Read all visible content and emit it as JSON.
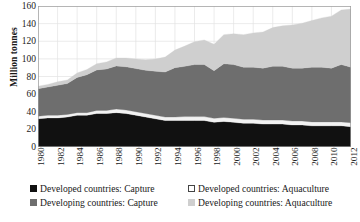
{
  "chart_data": {
    "type": "area",
    "stacked": true,
    "title": "",
    "xlabel": "",
    "ylabel": "Million tonnes",
    "ylim": [
      0,
      160
    ],
    "ytick_step": 20,
    "yticks": [
      0,
      20,
      40,
      60,
      80,
      100,
      120,
      140,
      160
    ],
    "grid": true,
    "grid_style": "light vertical and horizontal gridlines",
    "legend_position": "bottom",
    "x": [
      1980,
      1981,
      1982,
      1983,
      1984,
      1985,
      1986,
      1987,
      1988,
      1989,
      1990,
      1991,
      1992,
      1993,
      1994,
      1995,
      1996,
      1997,
      1998,
      1999,
      2000,
      2001,
      2002,
      2003,
      2004,
      2005,
      2006,
      2007,
      2008,
      2009,
      2010,
      2011,
      2012
    ],
    "xticks": [
      1980,
      1982,
      1984,
      1986,
      1988,
      1990,
      1992,
      1994,
      1996,
      1998,
      2000,
      2002,
      2004,
      2006,
      2008,
      2010,
      2012
    ],
    "series": [
      {
        "name": "Developed countries: Capture",
        "color": "#111111",
        "values": [
          32,
          33,
          33,
          34,
          36,
          36,
          38,
          38,
          39,
          38,
          36,
          34,
          32,
          30,
          30,
          30,
          30,
          30,
          28,
          29,
          28,
          27,
          27,
          26,
          26,
          26,
          25,
          25,
          24,
          24,
          24,
          24,
          23
        ]
      },
      {
        "name": "Developed countries: Aquaculture",
        "color": "#f2f2f2",
        "values": [
          3,
          3,
          3,
          3,
          3,
          3,
          3.5,
          3.5,
          4,
          4,
          4,
          4,
          4,
          4,
          4,
          4.5,
          4.5,
          4.5,
          4.5,
          4.5,
          4.5,
          4.5,
          4.5,
          4.5,
          4.5,
          4.5,
          4.5,
          4.5,
          4.5,
          4.5,
          4.5,
          4.5,
          4.5
        ]
      },
      {
        "name": "Developing countries: Capture",
        "color": "#6e6e6e",
        "values": [
          31,
          32,
          34,
          35,
          40,
          43,
          46,
          47,
          49,
          49,
          49,
          49,
          50,
          51,
          56,
          57,
          59,
          59,
          54,
          61,
          61,
          59,
          59,
          59,
          61,
          61,
          60,
          60,
          62,
          62,
          61,
          65,
          63
        ]
      },
      {
        "name": "Developing countries: Aquaculture",
        "color": "#cfcfcf",
        "values": [
          3,
          3,
          4,
          4,
          5,
          6,
          7,
          8,
          9,
          10,
          11,
          12,
          14,
          17,
          20,
          23,
          26,
          28,
          30,
          33,
          35,
          37,
          39,
          41,
          44,
          46,
          49,
          51,
          53,
          56,
          59,
          62,
          66
        ]
      }
    ]
  },
  "axis": {
    "y_title": "Million tonnes",
    "y_tick_labels": [
      "160",
      "140",
      "120",
      "100",
      "80",
      "60",
      "40",
      "20",
      "0"
    ],
    "x_tick_labels": [
      "1980",
      "1982",
      "1984",
      "1986",
      "1988",
      "1990",
      "1992",
      "1994",
      "1996",
      "1998",
      "2000",
      "2002",
      "2004",
      "2006",
      "2008",
      "2010",
      "2012"
    ]
  },
  "legend": {
    "items": [
      {
        "label": "Developed countries: Capture",
        "color": "#111111"
      },
      {
        "label": "Developing countries: Capture",
        "color": "#6e6e6e"
      },
      {
        "label": "Developed countries: Aquaculture",
        "color": "#ffffff"
      },
      {
        "label": "Developing countries: Aquaculture",
        "color": "#cfcfcf"
      }
    ]
  }
}
